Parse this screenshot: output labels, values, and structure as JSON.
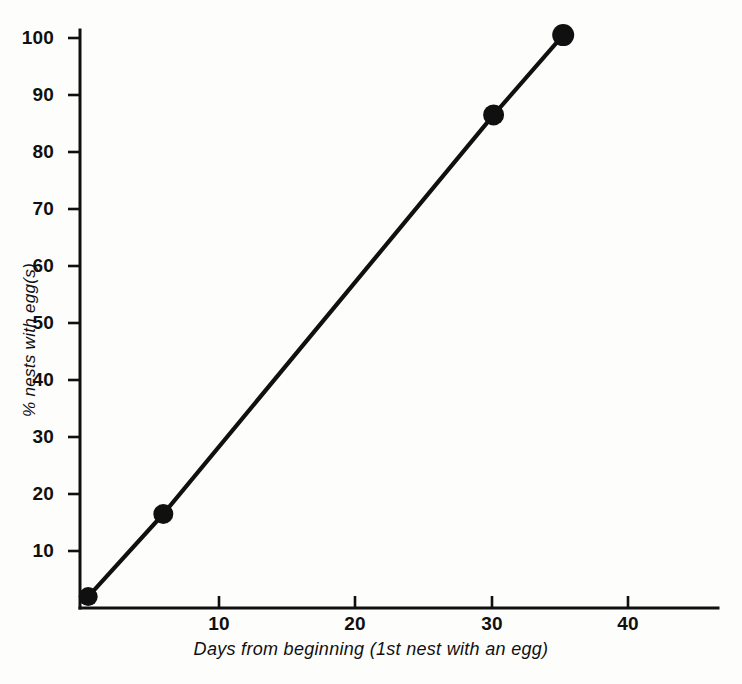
{
  "figure": {
    "background_color": "#fdfdfc",
    "ink_color": "#101010"
  },
  "chart_data": {
    "type": "line",
    "title": "",
    "subtitle": "",
    "xlabel": "Days from beginning (1st nest with an egg)",
    "ylabel": "% nests with egg(s)",
    "xlim": [
      0,
      46
    ],
    "ylim": [
      0,
      103
    ],
    "grid": false,
    "legend": "none",
    "marker": "filled-circle",
    "line_style": "solid",
    "x": [
      0.6,
      6.1,
      30.3,
      35.4
    ],
    "y": [
      2,
      16.5,
      86.5,
      100.5
    ],
    "points": [
      {
        "x": 0.6,
        "y": 2
      },
      {
        "x": 6.1,
        "y": 16.5
      },
      {
        "x": 30.3,
        "y": 86.5
      },
      {
        "x": 35.4,
        "y": 100.5
      }
    ],
    "series": [
      {
        "name": "% nests with egg(s)",
        "values": [
          2,
          16.5,
          86.5,
          100.5
        ]
      }
    ],
    "xticks": [
      10,
      20,
      30,
      40
    ],
    "xtick_labels": [
      "10",
      "20",
      "30",
      "40"
    ],
    "yticks": [
      10,
      20,
      30,
      40,
      50,
      60,
      70,
      80,
      90,
      100
    ],
    "ytick_labels": [
      "10",
      "20",
      "30",
      "40",
      "50",
      "60",
      "70",
      "80",
      "90",
      "100"
    ]
  },
  "axes": {
    "y_title": "% nests with egg(s)",
    "x_title": "Days from beginning (1st nest with an egg)",
    "y_labels": [
      "100",
      "90",
      "80",
      "70",
      "60",
      "50",
      "40",
      "30",
      "20",
      "10"
    ],
    "x_labels": [
      "10",
      "20",
      "30",
      "40"
    ]
  },
  "caption": {
    "ghost_text": ""
  }
}
